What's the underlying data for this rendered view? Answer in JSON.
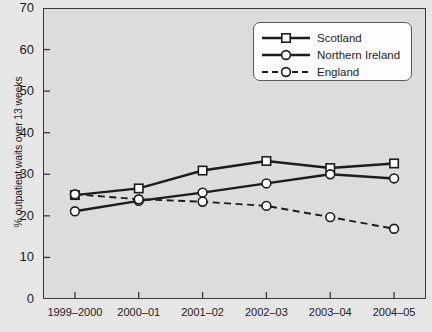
{
  "chart_data": {
    "type": "line",
    "title": "",
    "xlabel": "",
    "ylabel": "% outpatient waits over 13 weeks",
    "categories": [
      "1999–2000",
      "2000–01",
      "2001–02",
      "2002–03",
      "2003–04",
      "2004–05"
    ],
    "ylim": [
      0,
      70
    ],
    "yticks": [
      0,
      10,
      20,
      30,
      40,
      50,
      60,
      70
    ],
    "grid": false,
    "legend_position": "top-right",
    "series": [
      {
        "name": "Scotland",
        "marker": "square",
        "linestyle": "solid",
        "color": "#1c1c1c",
        "values": [
          25.0,
          26.6,
          30.9,
          33.2,
          31.5,
          32.6
        ]
      },
      {
        "name": "Northern Ireland",
        "marker": "circle",
        "linestyle": "solid",
        "color": "#1c1c1c",
        "values": [
          21.1,
          23.6,
          25.6,
          27.8,
          30.0,
          29.0
        ]
      },
      {
        "name": "England",
        "marker": "circle",
        "linestyle": "dashed",
        "color": "#1c1c1c",
        "values": [
          25.2,
          24.0,
          23.4,
          22.4,
          19.7,
          16.9
        ]
      }
    ]
  }
}
